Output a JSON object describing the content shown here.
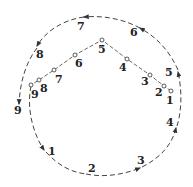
{
  "diagram": {
    "colors": {
      "line": "#444444",
      "text": "#222222",
      "background": "#ffffff"
    },
    "inner_path": {
      "points": [
        {
          "label": "1",
          "x": 171,
          "y": 91,
          "lx": 166,
          "ly": 104
        },
        {
          "label": "2",
          "x": 164,
          "y": 86,
          "lx": 155,
          "ly": 96
        },
        {
          "label": "3",
          "x": 150,
          "y": 75,
          "lx": 141,
          "ly": 85
        },
        {
          "label": "4",
          "x": 127,
          "y": 59,
          "lx": 119,
          "ly": 71
        },
        {
          "label": "5",
          "x": 102,
          "y": 40,
          "lx": 98,
          "ly": 53
        },
        {
          "label": "6",
          "x": 75,
          "y": 55,
          "lx": 75,
          "ly": 67
        },
        {
          "label": "7",
          "x": 54,
          "y": 70,
          "lx": 55,
          "ly": 83
        },
        {
          "label": "8",
          "x": 39,
          "y": 80,
          "lx": 40,
          "ly": 92
        },
        {
          "label": "9",
          "x": 31,
          "y": 85,
          "lx": 31,
          "ly": 98
        }
      ]
    },
    "outer_path": {
      "labels": [
        {
          "label": "1",
          "x": 48,
          "y": 155
        },
        {
          "label": "2",
          "x": 88,
          "y": 172
        },
        {
          "label": "3",
          "x": 137,
          "y": 164
        },
        {
          "label": "4",
          "x": 166,
          "y": 126
        },
        {
          "label": "5",
          "x": 165,
          "y": 76
        },
        {
          "label": "6",
          "x": 130,
          "y": 36
        },
        {
          "label": "7",
          "x": 77,
          "y": 30
        },
        {
          "label": "8",
          "x": 36,
          "y": 58
        },
        {
          "label": "9",
          "x": 14,
          "y": 114
        }
      ]
    }
  }
}
